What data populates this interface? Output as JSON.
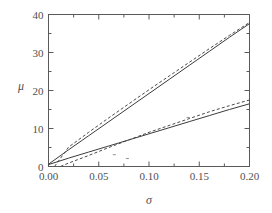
{
  "chart_data": {
    "type": "line",
    "title": "",
    "subtitle": "",
    "xlabel": "σ",
    "ylabel": "μ",
    "xlim": [
      0.0,
      0.2
    ],
    "ylim": [
      0,
      40
    ],
    "grid": false,
    "legend": "none",
    "x_ticks": [
      "0.00",
      "0.05",
      "0.10",
      "0.15",
      "0.20"
    ],
    "x_tick_values": [
      0.0,
      0.05,
      0.1,
      0.15,
      0.2
    ],
    "x_minor_ticks": [
      0.025,
      0.075,
      0.125,
      0.175
    ],
    "y_ticks": [
      "0",
      "10",
      "20",
      "30",
      "40"
    ],
    "y_tick_values": [
      0,
      10,
      20,
      30,
      40
    ],
    "y_minor_ticks": [
      5,
      15,
      25,
      35
    ],
    "series": [
      {
        "name": "upper-solid",
        "style": "solid",
        "color": "#3c3c3c",
        "x": [
          0.0,
          0.02,
          0.04,
          0.06,
          0.08,
          0.1,
          0.12,
          0.14,
          0.16,
          0.18,
          0.2
        ],
        "values": [
          0.6,
          4.4,
          8.1,
          11.8,
          15.5,
          19.2,
          22.9,
          26.6,
          30.3,
          34.0,
          37.6
        ]
      },
      {
        "name": "upper-dashed",
        "style": "dashed",
        "color": "#4a4a4a",
        "x": [
          0.006,
          0.02,
          0.04,
          0.06,
          0.08,
          0.1,
          0.12,
          0.14,
          0.16,
          0.18,
          0.2
        ],
        "values": [
          0.0,
          5.1,
          9.0,
          12.8,
          16.5,
          20.2,
          23.8,
          27.4,
          31.0,
          34.5,
          37.9
        ]
      },
      {
        "name": "lower-solid",
        "style": "solid",
        "color": "#3c3c3c",
        "x": [
          0.0,
          0.02,
          0.04,
          0.06,
          0.08,
          0.1,
          0.12,
          0.14,
          0.16,
          0.18,
          0.2
        ],
        "values": [
          0.5,
          2.2,
          3.8,
          5.4,
          7.0,
          8.6,
          10.2,
          11.8,
          13.4,
          15.0,
          16.5
        ]
      },
      {
        "name": "lower-dashed",
        "style": "dashed",
        "color": "#4a4a4a",
        "x": [
          0.012,
          0.02,
          0.04,
          0.06,
          0.08,
          0.1,
          0.12,
          0.14,
          0.16,
          0.18,
          0.2
        ],
        "values": [
          0.0,
          0.9,
          2.9,
          5.0,
          7.0,
          9.0,
          10.8,
          12.6,
          14.4,
          16.0,
          17.5
        ]
      }
    ],
    "stray_marks": [
      {
        "x": 0.0655,
        "y": 3.1
      },
      {
        "x": 0.0785,
        "y": 2.1
      },
      {
        "x": 0.139,
        "y": 12.9
      }
    ],
    "colors": {
      "axis": "#5a5a5a",
      "solid_line": "#3c3c3c",
      "dashed_line": "#4a4a4a",
      "background": "#ffffff",
      "text": "#4f4f4f"
    }
  }
}
